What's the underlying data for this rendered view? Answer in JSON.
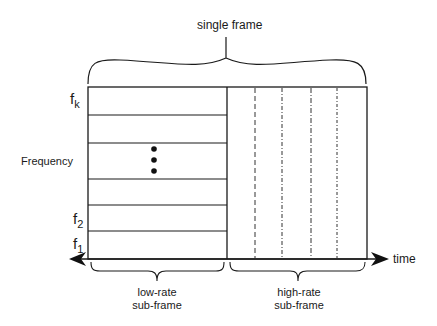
{
  "diagram": {
    "title_label": "single frame",
    "axis": {
      "y_label": "Frequency",
      "x_label": "time"
    },
    "frequency_labels": [
      {
        "base": "f",
        "sub": "k"
      },
      {
        "base": "f",
        "sub": "2"
      },
      {
        "base": "f",
        "sub": "1"
      }
    ],
    "ellipsis": "⋮",
    "sub_frames": [
      {
        "line1": "low-rate",
        "line2": "sub-frame"
      },
      {
        "line1": "high-rate",
        "line2": "sub-frame"
      }
    ],
    "colors": {
      "line": "#1a1a1a",
      "background": "#ffffff"
    }
  }
}
